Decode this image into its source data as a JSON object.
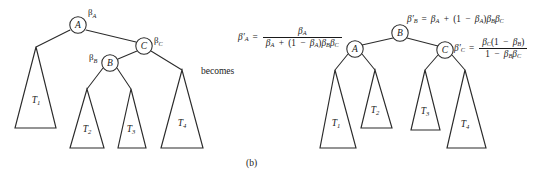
{
  "figure": {
    "caption": "(b)",
    "transition_label": "becomes",
    "background_color": "#ffffff",
    "stroke_color": "#2b2b2b"
  },
  "left_tree": {
    "name": "original-tree",
    "nodes": [
      {
        "id": "A",
        "label": "A",
        "beta": "β",
        "beta_sub": "A",
        "cx": 78,
        "cy": 25
      },
      {
        "id": "C",
        "label": "C",
        "beta": "β",
        "beta_sub": "C",
        "cx": 144,
        "cy": 46
      },
      {
        "id": "B",
        "label": "B",
        "beta": "β",
        "beta_sub": "B",
        "cx": 110,
        "cy": 63
      }
    ],
    "subtrees": [
      {
        "label": "T",
        "sub": "1"
      },
      {
        "label": "T",
        "sub": "2"
      },
      {
        "label": "T",
        "sub": "3"
      },
      {
        "label": "T",
        "sub": "4"
      }
    ]
  },
  "right_tree": {
    "name": "transformed-tree",
    "nodes": [
      {
        "id": "B",
        "label": "B",
        "cx": 400,
        "cy": 33
      },
      {
        "id": "A",
        "label": "A",
        "cx": 355,
        "cy": 49
      },
      {
        "id": "C",
        "label": "C",
        "cx": 445,
        "cy": 50
      }
    ],
    "subtrees": [
      {
        "label": "T",
        "sub": "1"
      },
      {
        "label": "T",
        "sub": "2"
      },
      {
        "label": "T",
        "sub": "3"
      },
      {
        "label": "T",
        "sub": "4"
      }
    ]
  },
  "equations": {
    "beta_a_prime": {
      "name": "beta-a-prime-equation",
      "lhs_symbol": "β",
      "lhs_sub": "A",
      "lhs_prime": "′",
      "operator": "=",
      "numerator": "β",
      "numerator_sub": "A",
      "denominator_text": "β_A + (1 − β_A)β_B β_C",
      "plain": "β'A = βA / (βA + (1 − βA)βB βC)"
    },
    "beta_b_prime": {
      "name": "beta-b-prime-equation",
      "lhs_symbol": "β",
      "lhs_sub": "B",
      "lhs_prime": "′",
      "operator": "=",
      "rhs_text": "β_A + (1 − β_A)β_B β_C",
      "plain": "β'B = βA + (1 − βA)βB βC"
    },
    "beta_c_prime": {
      "name": "beta-c-prime-equation",
      "lhs_symbol": "β",
      "lhs_sub": "C",
      "lhs_prime": "′",
      "operator": "=",
      "numerator_text": "β_C(1 − β_B)",
      "denominator_text": "1 − β_B β_C",
      "plain": "β'C = βC(1 − βB) / (1 − βB βC)"
    }
  }
}
